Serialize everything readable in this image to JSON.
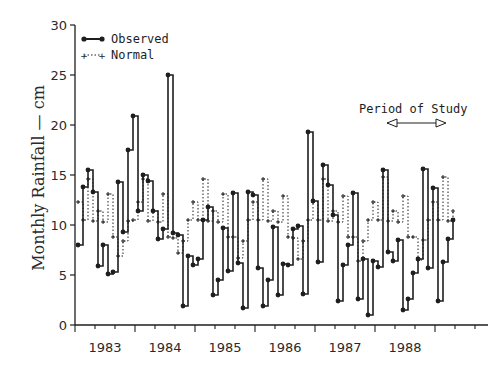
{
  "chart_data": {
    "type": "line",
    "subtype": "step",
    "title": "",
    "xlabel": "",
    "ylabel": "Monthly Rainfall — cm",
    "ylim": [
      0,
      30
    ],
    "yticks": [
      0,
      5,
      10,
      15,
      20,
      25,
      30
    ],
    "xtick_labels": [
      "1983",
      "1984",
      "1985",
      "1986",
      "1987",
      "1988"
    ],
    "x_start_year_fraction": 1982.92,
    "months_count": 72,
    "grid": false,
    "legend": {
      "position": "upper left",
      "entries": [
        {
          "label": "Observed",
          "style": "solid line with filled circle markers"
        },
        {
          "label": "Normal",
          "style": "dotted line with plus markers"
        }
      ]
    },
    "annotations": [
      {
        "text": "Period of Study",
        "arrow": "double-headed",
        "x_range": [
          1987.7,
          1988.7
        ]
      }
    ],
    "series": [
      {
        "name": "Observed",
        "values": [
          8,
          13.8,
          15.5,
          13.3,
          5.9,
          8,
          5.1,
          5.3,
          14.3,
          9.3,
          17.5,
          20.9,
          11.4,
          15,
          14.4,
          11.4,
          8.6,
          9.6,
          25,
          9.2,
          9,
          1.9,
          6.9,
          6,
          6.6,
          10.5,
          11.8,
          3,
          4.5,
          9.7,
          5.4,
          13.2,
          6.2,
          1.7,
          13.3,
          13,
          5.7,
          1.9,
          4.5,
          9.8,
          3,
          6.1,
          6,
          9.6,
          9.9,
          3.1,
          19.3,
          12.4,
          6.3,
          16,
          14,
          11,
          2.4,
          6,
          8,
          13.2,
          2.6,
          6.6,
          1.0,
          6.4,
          5.8,
          15.5,
          7.3,
          6.4,
          8.5,
          1.5,
          2.6,
          5.2,
          6.6,
          15.6,
          5.7,
          13.7,
          2.4,
          6.3,
          8.6,
          10.5
        ]
      },
      {
        "name": "Normal",
        "values": [
          12.3,
          10.5,
          14.6,
          10.4,
          11.4,
          10.3,
          13.1,
          8.8,
          6.9,
          8.4,
          10.4,
          10.5,
          12.3,
          14.6,
          10.4,
          11.4,
          10.3,
          13.1,
          8.8,
          8.7,
          7.2,
          8.4,
          10.5,
          12.3,
          10.5,
          14.6,
          10.4,
          11.4,
          10.3,
          13.1,
          8.8,
          8.8,
          6.7,
          8.4,
          10.5,
          12.3,
          10.5,
          14.6,
          10.4,
          11.4,
          10.3,
          12.9,
          8.8,
          8.7,
          6.6,
          8.4,
          10.5,
          12.3,
          10.5,
          14.6,
          10.4,
          11.4,
          10.3,
          12.9,
          8.8,
          8.8,
          6.4,
          8.4,
          10.5,
          12.3,
          10.5,
          14.8,
          10.4,
          11.4,
          10.3,
          12.9,
          8.8,
          8.8,
          6.5,
          8.5,
          10.5,
          12.3,
          10.5,
          14.8,
          10.4,
          11.4
        ]
      }
    ]
  },
  "legend": {
    "observed_label": "Observed",
    "normal_label": "Normal"
  },
  "annotation": {
    "period_label": "Period of Study"
  },
  "axes": {
    "ylabel": "Monthly Rainfall — cm"
  },
  "colors": {
    "ink": "#1e1e1e",
    "background": "#ffffff"
  }
}
